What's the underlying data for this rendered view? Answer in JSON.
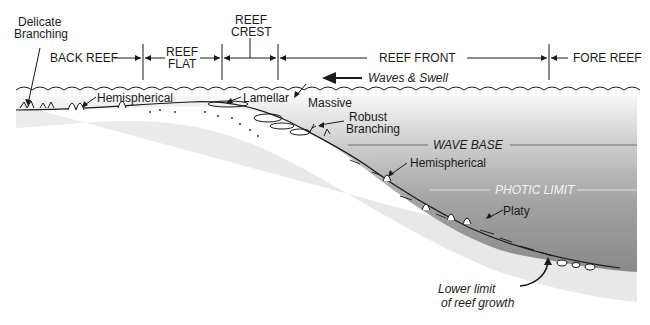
{
  "zones": [
    {
      "label": "BACK REEF"
    },
    {
      "label_line1": "REEF",
      "label_line2": "FLAT"
    },
    {
      "label_line1": "REEF",
      "label_line2": "CREST"
    },
    {
      "label": "REEF FRONT"
    },
    {
      "label": "FORE REEF"
    }
  ],
  "annotations": {
    "delicate_branching_1": "Delicate",
    "delicate_branching_2": "Branching",
    "hemispherical_top": "Hemispherical",
    "lamellar": "Lamellar",
    "massive": "Massive",
    "robust_1": "Robust",
    "robust_2": "Branching",
    "hemispherical_slope": "Hemispherical",
    "platy": "Platy",
    "waves": "Waves & Swell",
    "wave_base": "WAVE BASE",
    "photic_limit": "PHOTIC LIMIT",
    "lower_limit_1": "Lower limit",
    "lower_limit_2": "of reef growth"
  },
  "colors": {
    "line": "#1a1a1a",
    "water_light": "#f3f3f3",
    "water_dark": "#8c8c8c",
    "sediment": "#e6e6e6"
  }
}
